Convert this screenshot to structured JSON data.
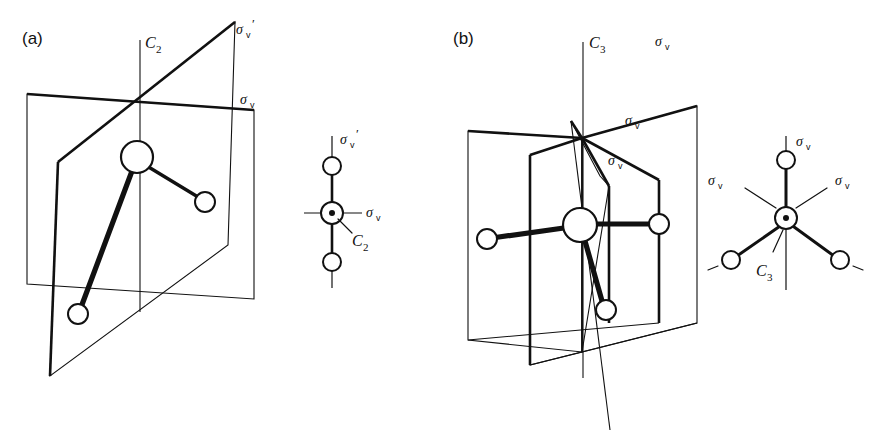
{
  "figure": {
    "background_color": "#ffffff",
    "line_color": "#111111",
    "width": 873,
    "height": 436
  },
  "panels": [
    {
      "id": "a",
      "label": "(a)",
      "point_group": "C2v",
      "main_view": {
        "axis_label": "C",
        "axis_subscript": "2",
        "axis_name": "C2",
        "planes": [
          {
            "name": "sigma-v-plane",
            "label": "σ",
            "subscript": "v",
            "prime": ""
          },
          {
            "name": "sigma-v-prime-plane",
            "label": "σ",
            "subscript": "v",
            "prime": "′"
          }
        ],
        "atoms": [
          {
            "name": "central-atom",
            "radius": 16
          },
          {
            "name": "ligand-atom-right",
            "radius": 10
          },
          {
            "name": "ligand-atom-lower-left",
            "radius": 10
          }
        ]
      },
      "inset_view": {
        "name": "newman-projection-c2v",
        "top_label": "σ",
        "top_subscript": "v",
        "top_prime": "′",
        "side_label": "σ",
        "side_subscript": "v",
        "axis_label": "C",
        "axis_subscript": "2",
        "atom_count": 3
      }
    },
    {
      "id": "b",
      "label": "(b)",
      "point_group": "C3v",
      "main_view": {
        "axis_label": "C",
        "axis_subscript": "3",
        "axis_name": "C3",
        "planes": [
          {
            "name": "sigma-v-plane-1",
            "label": "σ",
            "subscript": "v"
          },
          {
            "name": "sigma-v-plane-2",
            "label": "σ",
            "subscript": "v"
          },
          {
            "name": "sigma-v-plane-3",
            "label": "σ",
            "subscript": "v"
          }
        ],
        "atoms": [
          {
            "name": "central-atom",
            "radius": 17
          },
          {
            "name": "ligand-atom-left",
            "radius": 10
          },
          {
            "name": "ligand-atom-right",
            "radius": 10
          },
          {
            "name": "ligand-atom-lower",
            "radius": 10
          }
        ]
      },
      "inset_view": {
        "name": "newman-projection-c3v",
        "labels": [
          {
            "name": "sigma-v-top",
            "text": "σ",
            "subscript": "v"
          },
          {
            "name": "sigma-v-left",
            "text": "σ",
            "subscript": "v"
          },
          {
            "name": "sigma-v-right",
            "text": "σ",
            "subscript": "v"
          }
        ],
        "axis_label": "C",
        "axis_subscript": "3",
        "atom_count": 4
      }
    }
  ],
  "symbols": {
    "sigma": "σ",
    "prime": "′",
    "subscript_v": "v",
    "subscript_2": "2",
    "subscript_3": "3",
    "C": "C"
  }
}
